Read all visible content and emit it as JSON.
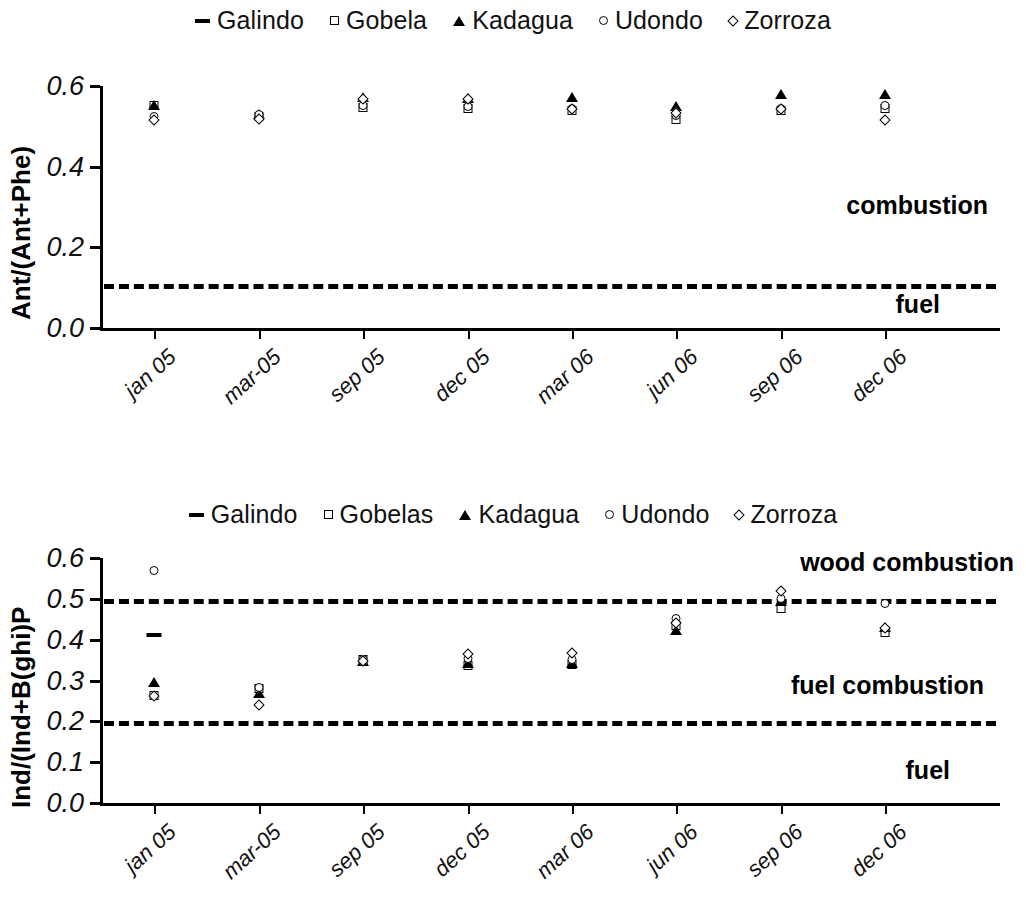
{
  "figure": {
    "panels": [
      {
        "id": "panel-ant-phe",
        "ylabel": "Ant/(Ant+Phe)",
        "annotations": [
          {
            "text": "combustion",
            "value_ref": 0.3
          },
          {
            "text": "fuel",
            "value_ref": 0.055
          }
        ],
        "legend": [
          {
            "label": "Galindo",
            "marker": "dash-marker"
          },
          {
            "label": "Gobela",
            "marker": "square-marker"
          },
          {
            "label": "Kadagua",
            "marker": "triangle-marker"
          },
          {
            "label": "Udondo",
            "marker": "circle-marker"
          },
          {
            "label": "Zorroza",
            "marker": "diamond-marker"
          }
        ]
      },
      {
        "id": "panel-ind-bghip",
        "ylabel": "Ind/(Ind+B(ghi)P",
        "annotations": [
          {
            "text": "wood combustion",
            "value_ref": 0.585
          },
          {
            "text": "fuel combustion",
            "value_ref": 0.285
          },
          {
            "text": "fuel",
            "value_ref": 0.075
          }
        ],
        "legend": [
          {
            "label": "Galindo",
            "marker": "dash-marker"
          },
          {
            "label": "Gobelas",
            "marker": "square-marker"
          },
          {
            "label": "Kadagua",
            "marker": "triangle-marker"
          },
          {
            "label": "Udondo",
            "marker": "circle-marker"
          },
          {
            "label": "Zorroza",
            "marker": "diamond-marker"
          }
        ]
      }
    ]
  },
  "chart_data": [
    {
      "type": "scatter",
      "title": "",
      "xlabel": "",
      "ylabel": "Ant/(Ant+Phe)",
      "ylim": [
        0.0,
        0.6
      ],
      "yticks": [
        "0.0",
        "0.2",
        "0.4",
        "0.6"
      ],
      "ytick_values": [
        0.0,
        0.2,
        0.4,
        0.6
      ],
      "grid": false,
      "legend_position": "top-center",
      "categories": [
        "jan 05",
        "mar-05",
        "sep 05",
        "dec 05",
        "mar 06",
        "jun 06",
        "sep 06",
        "dec 06"
      ],
      "series": [
        {
          "name": "Galindo",
          "marker": "dash-marker",
          "values": [
            null,
            null,
            null,
            null,
            null,
            null,
            null,
            null
          ]
        },
        {
          "name": "Gobela",
          "marker": "square-marker",
          "values": [
            0.553,
            0.525,
            0.549,
            0.545,
            0.54,
            0.519,
            0.541,
            0.546
          ]
        },
        {
          "name": "Kadagua",
          "marker": "triangle-marker",
          "values": [
            0.556,
            0.534,
            0.575,
            0.573,
            0.574,
            0.552,
            0.583,
            0.583
          ]
        },
        {
          "name": "Udondo",
          "marker": "circle-marker",
          "values": [
            0.525,
            0.53,
            0.553,
            0.551,
            0.546,
            0.528,
            0.546,
            0.552
          ]
        },
        {
          "name": "Zorroza",
          "marker": "diamond-marker",
          "values": [
            0.519,
            0.521,
            0.57,
            0.571,
            0.545,
            0.536,
            0.545,
            0.519
          ]
        }
      ],
      "reference_lines": [
        {
          "value": 0.108,
          "style": "dashed",
          "label_above": "combustion",
          "label_below": "fuel"
        }
      ]
    },
    {
      "type": "scatter",
      "title": "",
      "xlabel": "",
      "ylabel": "Ind/(Ind+B(ghi)P",
      "ylim": [
        0.0,
        0.6
      ],
      "yticks": [
        "0.0",
        "0.1",
        "0.2",
        "0.3",
        "0.4",
        "0.5",
        "0.6"
      ],
      "ytick_values": [
        0.0,
        0.1,
        0.2,
        0.3,
        0.4,
        0.5,
        0.6
      ],
      "grid": false,
      "legend_position": "top-center",
      "categories": [
        "jan 05",
        "mar-05",
        "sep 05",
        "dec 05",
        "mar 06",
        "jun 06",
        "sep 06",
        "dec 06"
      ],
      "series": [
        {
          "name": "Galindo",
          "marker": "dash-marker",
          "values": [
            0.418,
            null,
            null,
            null,
            null,
            null,
            null,
            null
          ]
        },
        {
          "name": "Gobelas",
          "marker": "square-marker",
          "values": [
            0.265,
            0.281,
            0.352,
            0.337,
            0.34,
            0.437,
            0.478,
            0.42
          ]
        },
        {
          "name": "Kadagua",
          "marker": "triangle-marker",
          "values": [
            0.298,
            0.272,
            0.35,
            0.345,
            0.345,
            0.425,
            0.497,
            0.434
          ]
        },
        {
          "name": "Udondo",
          "marker": "circle-marker",
          "values": [
            0.57,
            0.285,
            0.353,
            0.356,
            0.352,
            0.452,
            0.501,
            0.49
          ]
        },
        {
          "name": "Zorroza",
          "marker": "diamond-marker",
          "values": [
            0.265,
            0.243,
            0.351,
            0.368,
            0.37,
            0.443,
            0.521,
            0.432
          ]
        }
      ],
      "reference_lines": [
        {
          "value": 0.5,
          "style": "dashed",
          "label_above": "wood combustion",
          "label_below": "fuel combustion"
        },
        {
          "value": 0.2,
          "style": "dashed",
          "label_below": "fuel"
        }
      ]
    }
  ]
}
